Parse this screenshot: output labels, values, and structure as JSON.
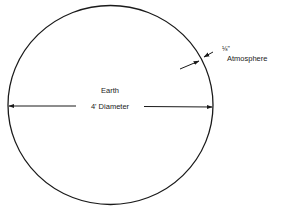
{
  "diagram": {
    "type": "labeled-figure",
    "labels": {
      "earth": "Earth",
      "diameter": "4' Diameter",
      "atmosphere_thickness": "⅛\"",
      "atmosphere": "Atmosphere"
    },
    "colors": {
      "line": "#1a1a1a",
      "background": "#ffffff"
    }
  }
}
